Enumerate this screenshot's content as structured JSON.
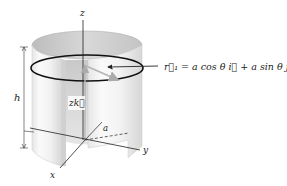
{
  "figure": {
    "type": "cylinder-coordinate-diagram",
    "labels": {
      "z_axis": "z",
      "x_axis": "x",
      "y_axis": "y",
      "height": "h",
      "radius": "a",
      "vertical_vector": "zk⃗"
    },
    "equation": {
      "lhs": "r⃗₁",
      "equals": "=",
      "term1": "a cos θ i⃗",
      "plus": "+",
      "term2": "a sin θ j⃗"
    },
    "colors": {
      "cylinder_outer": "#eeeeee",
      "cylinder_inner": "#c8c8c8",
      "ring": "#111111",
      "axes": "#222222",
      "vector": "#b8b8b8"
    }
  }
}
